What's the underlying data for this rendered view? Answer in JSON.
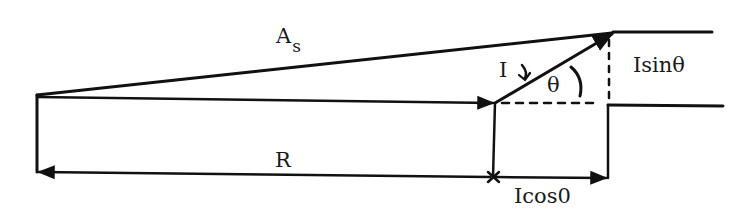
{
  "diagram": {
    "type": "phasor-diagram",
    "labels": {
      "apparent": "A",
      "apparent_sub": "s",
      "resultant": "R",
      "current": "I",
      "angle": "θ",
      "sine_component": "Isinθ",
      "cosine_component": "Icos0"
    },
    "colors": {
      "line": "#111111",
      "background": "#ffffff"
    }
  }
}
